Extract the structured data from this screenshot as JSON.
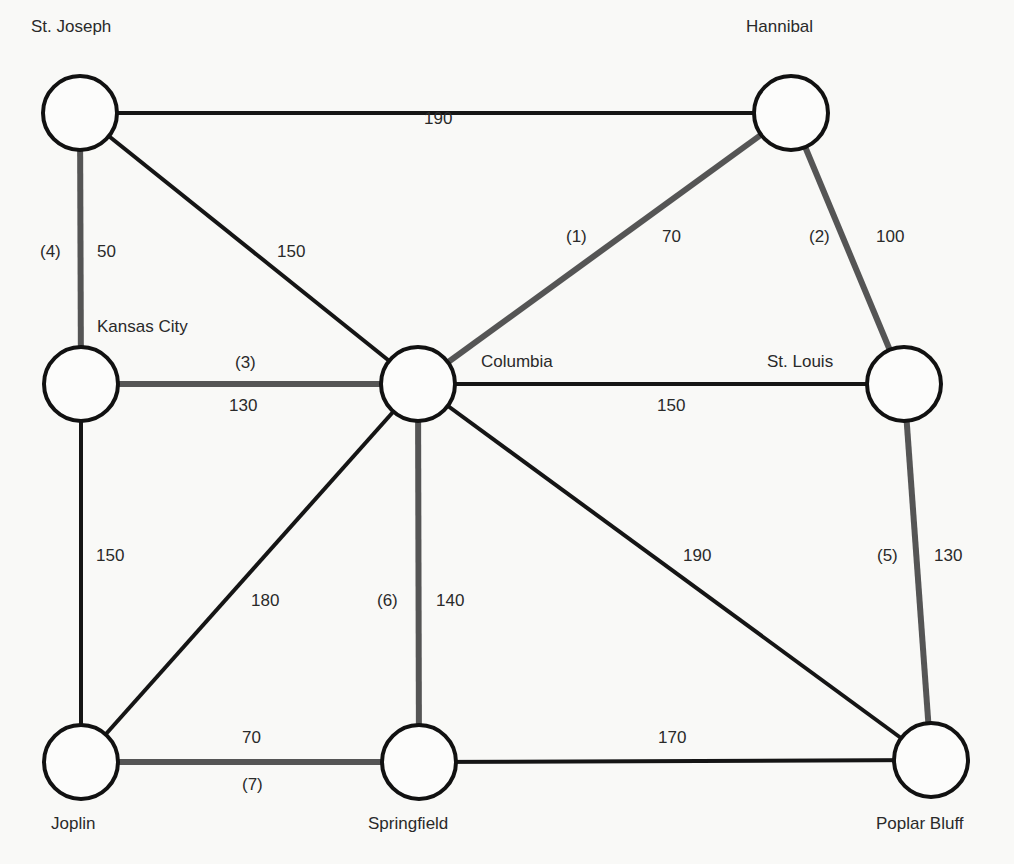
{
  "diagram": {
    "type": "weighted-graph",
    "colors": {
      "background": "#f9f9f7",
      "node_stroke": "#111111",
      "edge_normal": "#151515",
      "edge_highlight": "#555555",
      "text": "#2a2a2a"
    },
    "nodes": [
      {
        "id": "stjoseph",
        "label": "St. Joseph",
        "x": 80,
        "y": 113,
        "label_x": 31,
        "label_y": 18
      },
      {
        "id": "hannibal",
        "label": "Hannibal",
        "x": 791,
        "y": 113,
        "label_x": 746,
        "label_y": 18
      },
      {
        "id": "kansascity",
        "label": "Kansas City",
        "x": 81,
        "y": 384,
        "label_x": 97,
        "label_y": 318
      },
      {
        "id": "columbia",
        "label": "Columbia",
        "x": 418,
        "y": 384,
        "label_x": 481,
        "label_y": 353
      },
      {
        "id": "stlouis",
        "label": "St. Louis",
        "x": 904,
        "y": 384,
        "label_x": 767,
        "label_y": 353
      },
      {
        "id": "joplin",
        "label": "Joplin",
        "x": 81,
        "y": 762,
        "label_x": 51,
        "label_y": 815
      },
      {
        "id": "springfield",
        "label": "Springfield",
        "x": 419,
        "y": 762,
        "label_x": 368,
        "label_y": 815
      },
      {
        "id": "poplarbluff",
        "label": "Poplar Bluff",
        "x": 931,
        "y": 760,
        "label_x": 876,
        "label_y": 815
      }
    ],
    "edges": [
      {
        "from": "stjoseph",
        "to": "hannibal",
        "weight": "190",
        "highlight": false,
        "order": null,
        "weight_x": 424,
        "weight_y": 110
      },
      {
        "from": "stjoseph",
        "to": "kansascity",
        "weight": "50",
        "highlight": true,
        "order": "(4)",
        "weight_x": 97,
        "weight_y": 243,
        "order_x": 40,
        "order_y": 243
      },
      {
        "from": "stjoseph",
        "to": "columbia",
        "weight": "150",
        "highlight": false,
        "order": null,
        "weight_x": 277,
        "weight_y": 243
      },
      {
        "from": "hannibal",
        "to": "columbia",
        "weight": "70",
        "highlight": true,
        "order": "(1)",
        "weight_x": 662,
        "weight_y": 228,
        "order_x": 566,
        "order_y": 228
      },
      {
        "from": "hannibal",
        "to": "stlouis",
        "weight": "100",
        "highlight": true,
        "order": "(2)",
        "weight_x": 876,
        "weight_y": 228,
        "order_x": 809,
        "order_y": 228
      },
      {
        "from": "kansascity",
        "to": "columbia",
        "weight": "130",
        "highlight": true,
        "order": "(3)",
        "weight_x": 229,
        "weight_y": 397,
        "order_x": 235,
        "order_y": 354
      },
      {
        "from": "columbia",
        "to": "stlouis",
        "weight": "150",
        "highlight": false,
        "order": null,
        "weight_x": 657,
        "weight_y": 397
      },
      {
        "from": "kansascity",
        "to": "joplin",
        "weight": "150",
        "highlight": false,
        "order": null,
        "weight_x": 96,
        "weight_y": 547
      },
      {
        "from": "columbia",
        "to": "joplin",
        "weight": "180",
        "highlight": false,
        "order": null,
        "weight_x": 251,
        "weight_y": 592
      },
      {
        "from": "columbia",
        "to": "springfield",
        "weight": "140",
        "highlight": true,
        "order": "(6)",
        "weight_x": 436,
        "weight_y": 592,
        "order_x": 377,
        "order_y": 592
      },
      {
        "from": "columbia",
        "to": "poplarbluff",
        "weight": "190",
        "highlight": false,
        "order": null,
        "weight_x": 683,
        "weight_y": 547
      },
      {
        "from": "stlouis",
        "to": "poplarbluff",
        "weight": "130",
        "highlight": true,
        "order": "(5)",
        "weight_x": 934,
        "weight_y": 547,
        "order_x": 877,
        "order_y": 547
      },
      {
        "from": "joplin",
        "to": "springfield",
        "weight": "70",
        "highlight": true,
        "order": "(7)",
        "weight_x": 242,
        "weight_y": 729,
        "order_x": 242,
        "order_y": 776
      },
      {
        "from": "springfield",
        "to": "poplarbluff",
        "weight": "170",
        "highlight": false,
        "order": null,
        "weight_x": 658,
        "weight_y": 729
      }
    ],
    "node_radius": 37
  }
}
